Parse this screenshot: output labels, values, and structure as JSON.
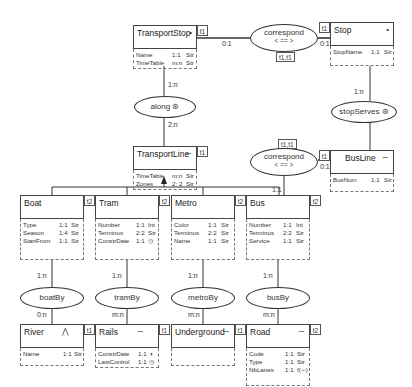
{
  "diagram": {
    "type": "conceptual-schema",
    "entities": [
      {
        "id": "TransportStop",
        "name": "TransportStop",
        "symbol": "•",
        "time": "t1",
        "attributes": [
          {
            "name": "Name",
            "card": "1:1",
            "type": "Str"
          },
          {
            "name": "TimeTable",
            "card": "m:n",
            "type": "Str"
          }
        ]
      },
      {
        "id": "Stop",
        "name": "Stop",
        "symbol": "•",
        "time": "t1",
        "attributes": [
          {
            "name": "StopName",
            "card": "1:1",
            "type": "Str"
          }
        ]
      },
      {
        "id": "TransportLine",
        "name": "TransportLine",
        "symbol": "∽",
        "time": "t1",
        "attributes": [
          {
            "name": "TimeTable",
            "card": "m:n",
            "type": "Str"
          },
          {
            "name": "Zones",
            "card": "2: 2",
            "type": "Str"
          }
        ]
      },
      {
        "id": "BusLine",
        "name": "BusLine",
        "symbol": "∽",
        "time": "t1",
        "attributes": [
          {
            "name": "BusNum",
            "card": "1:1",
            "type": "Str"
          }
        ]
      },
      {
        "id": "Boat",
        "name": "Boat",
        "symbol": "",
        "time": "t2",
        "attributes": [
          {
            "name": "Type",
            "card": "1:1",
            "type": "Str"
          },
          {
            "name": "Season",
            "card": "1:4",
            "type": "Str"
          },
          {
            "name": "StartFrom",
            "card": "1:1",
            "type": "Str"
          }
        ]
      },
      {
        "id": "Tram",
        "name": "Tram",
        "symbol": "",
        "time": "t2",
        "attributes": [
          {
            "name": "Number",
            "card": "1:1",
            "type": "Int"
          },
          {
            "name": "Terminus",
            "card": "2:2",
            "type": "Str"
          },
          {
            "name": "ConstrDate",
            "card": "1:1",
            "type": "◷"
          }
        ]
      },
      {
        "id": "Metro",
        "name": "Metro",
        "symbol": "",
        "time": "t2",
        "attributes": [
          {
            "name": "Color",
            "card": "1:1",
            "type": "Str"
          },
          {
            "name": "Terminus",
            "card": "2:2",
            "type": "Str"
          },
          {
            "name": "Name",
            "card": "1:1",
            "type": "Str"
          }
        ]
      },
      {
        "id": "Bus",
        "name": "Bus",
        "symbol": "",
        "time": "t2",
        "attributes": [
          {
            "name": "Number",
            "card": "1:1",
            "type": "Int"
          },
          {
            "name": "Terminus",
            "card": "2:2",
            "type": "Str"
          },
          {
            "name": "Service",
            "card": "1:1",
            "type": "Str"
          }
        ]
      },
      {
        "id": "River",
        "name": "River",
        "symbol": "⋀",
        "time": "t1",
        "attributes": [
          {
            "name": "Name",
            "card": "1:1",
            "type": "Str"
          }
        ]
      },
      {
        "id": "Rails",
        "name": "Rails",
        "symbol": "∽",
        "time": "t1",
        "attributes": [
          {
            "name": "ConstrDate",
            "card": "1:1",
            "type": "◑"
          },
          {
            "name": "LastControl",
            "card": "1:1",
            "type": "◷"
          }
        ]
      },
      {
        "id": "Underground",
        "name": "Underground",
        "symbol": "∽",
        "time": "t1",
        "attributes": []
      },
      {
        "id": "Road",
        "name": "Road",
        "symbol": "∽",
        "time": "t2",
        "attributes": [
          {
            "name": "Code",
            "card": "1:1",
            "type": "Str"
          },
          {
            "name": "Type",
            "card": "1:1",
            "type": "Str"
          },
          {
            "name": "NbLanes",
            "card": "1:1",
            "type": "f(∽)"
          }
        ]
      }
    ],
    "relationships": [
      {
        "id": "correspond1",
        "name": "correspond",
        "sub": "< == >",
        "badge": "t1,t1",
        "cards": [
          "0:1",
          "0:1"
        ]
      },
      {
        "id": "along",
        "name": "along",
        "symbol": "⊛",
        "cards": [
          "1:n",
          "2:n"
        ]
      },
      {
        "id": "stopServes",
        "name": "stopServes",
        "symbol": "⊛",
        "cards": [
          "1:n"
        ]
      },
      {
        "id": "correspond2",
        "name": "correspond",
        "sub": "< == >",
        "badge": "t1,t1",
        "cards": [
          "0:1",
          "1:1"
        ]
      },
      {
        "id": "boatBy",
        "name": "boatBy",
        "cards": [
          "1:n",
          "0:n"
        ]
      },
      {
        "id": "tramBy",
        "name": "tramBy",
        "cards": [
          "1:n",
          "m:n"
        ]
      },
      {
        "id": "metroBy",
        "name": "metroBy",
        "cards": [
          "1:n",
          "m:n"
        ]
      },
      {
        "id": "busBy",
        "name": "busBy",
        "cards": [
          "1:n",
          "m:n"
        ]
      }
    ],
    "generalization": {
      "parent": "TransportLine",
      "children": [
        "Boat",
        "Tram",
        "Metro",
        "Bus"
      ]
    }
  }
}
